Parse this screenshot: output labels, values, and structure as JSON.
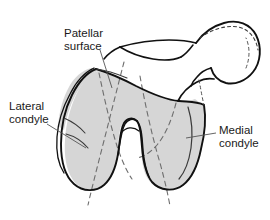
{
  "figure": {
    "background_color": "#ffffff",
    "outline_color": "#111111",
    "shading_color": "#d6d6d6",
    "dash_color": "#6e6e6e",
    "leader_color": "#555555",
    "text_color": "#1a1a1a"
  },
  "labels": {
    "patellar_surface": {
      "line1": "Patellar",
      "line2": "surface"
    },
    "lateral_condyle": {
      "line1": "Lateral",
      "line2": "condyle"
    },
    "medial_condyle": {
      "line1": "Medial",
      "line2": "condyle"
    }
  }
}
